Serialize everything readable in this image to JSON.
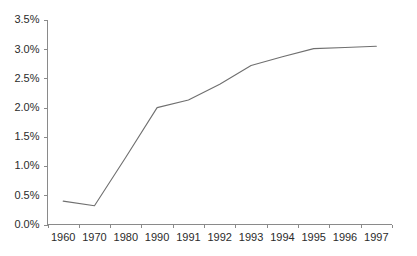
{
  "chart_data": {
    "type": "line",
    "title": "",
    "subtitle": "",
    "xlabel": "",
    "ylabel": "",
    "categories": [
      "1960",
      "1970",
      "1980",
      "1990",
      "1991",
      "1992",
      "1993",
      "1994",
      "1995",
      "1996",
      "1997"
    ],
    "series": [
      {
        "name": "",
        "values": [
          0.4,
          0.32,
          1.15,
          2.0,
          2.13,
          2.4,
          2.72,
          2.87,
          3.01,
          3.03,
          3.05
        ]
      }
    ],
    "ylim": [
      0.0,
      3.5
    ],
    "ytick_values": [
      0.0,
      0.5,
      1.0,
      1.5,
      2.0,
      2.5,
      3.0,
      3.5
    ],
    "ytick_labels": [
      "0.0%",
      "0.5%",
      "1.0%",
      "1.5%",
      "2.0%",
      "2.5%",
      "3.0%",
      "3.5%"
    ],
    "xtick_labels": [
      "1960",
      "1970",
      "1980",
      "1990",
      "1991",
      "1992",
      "1993",
      "1994",
      "1995",
      "1996",
      "1997"
    ],
    "grid": false,
    "legend": false,
    "legend_position": "none",
    "annotations": [],
    "colors": {
      "line": "#6f6f6f",
      "axis": "#8a8a8a",
      "text": "#2b2b2b",
      "background": "#ffffff"
    }
  },
  "axes": {
    "y_axis_name": "percent-axis",
    "x_axis_name": "year-axis"
  }
}
